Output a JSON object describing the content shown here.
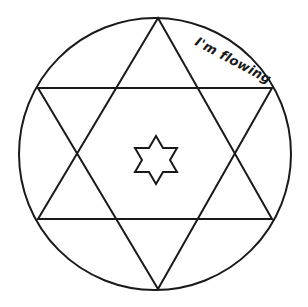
{
  "canvas": {
    "width": 308,
    "height": 307,
    "background_color": "#ffffff",
    "stroke_color": "#1a1a1a",
    "fill_color": "none"
  },
  "annotation": {
    "text": "I'm flowing",
    "rotation_degrees": 28,
    "x": 196,
    "y": 33,
    "color": "#1a1a1a",
    "font_size": 13
  },
  "chart_data": {
    "type": "diagram",
    "shapes": [
      {
        "name": "outer-circle",
        "type": "circle",
        "cx": 155,
        "cy": 154,
        "r": 136,
        "stroke": "#1a1a1a",
        "stroke_width": 2,
        "fill": "none"
      },
      {
        "name": "upward-triangle",
        "type": "polygon",
        "points": [
          [
            158,
            18
          ],
          [
            272,
            219
          ],
          [
            38,
            219
          ]
        ],
        "stroke": "#1a1a1a",
        "stroke_width": 2,
        "fill": "none"
      },
      {
        "name": "downward-triangle",
        "type": "polygon",
        "points": [
          [
            158,
            289
          ],
          [
            38,
            88
          ],
          [
            272,
            88
          ]
        ],
        "stroke": "#1a1a1a",
        "stroke_width": 2,
        "fill": "none"
      },
      {
        "name": "center-star",
        "type": "polygon",
        "points": [
          [
            156,
            136
          ],
          [
            163,
            148
          ],
          [
            177,
            148
          ],
          [
            170,
            160
          ],
          [
            177,
            172
          ],
          [
            163,
            172
          ],
          [
            156,
            184
          ],
          [
            149,
            172
          ],
          [
            135,
            172
          ],
          [
            142,
            160
          ],
          [
            135,
            148
          ],
          [
            149,
            148
          ]
        ],
        "stroke": "#1a1a1a",
        "stroke_width": 2,
        "fill": "#ffffff"
      }
    ],
    "vertices": {
      "top_apex": [
        158,
        18
      ],
      "bottom_apex": [
        158,
        289
      ],
      "upper_left": [
        38,
        88
      ],
      "upper_right": [
        272,
        88
      ],
      "lower_left": [
        38,
        219
      ],
      "lower_right": [
        272,
        219
      ]
    },
    "xlabel": "",
    "ylabel": "",
    "grid": false,
    "legend": false
  }
}
